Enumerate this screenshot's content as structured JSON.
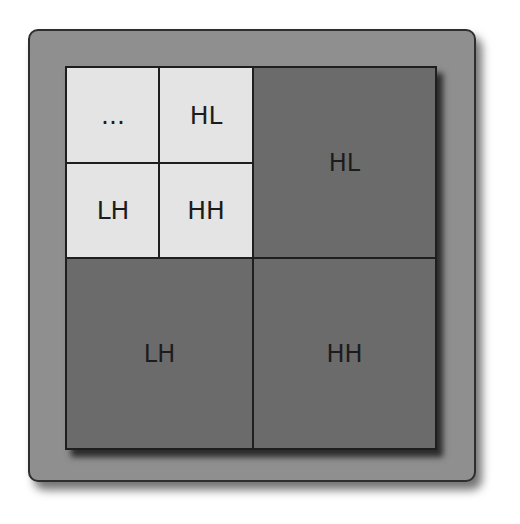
{
  "diagram": {
    "title": "",
    "level2": {
      "top_left": "...",
      "top_right": "HL",
      "bottom_left": "LH",
      "bottom_right": "HH"
    },
    "level1": {
      "top_right": "HL",
      "bottom_left": "LH",
      "bottom_right": "HH"
    },
    "colors": {
      "frame": "#8f8f8f",
      "light_cell": "#e4e4e4",
      "dark_cell": "#6b6b6b",
      "lines": "#1e1e1e",
      "text": "#1c1c1c"
    }
  }
}
